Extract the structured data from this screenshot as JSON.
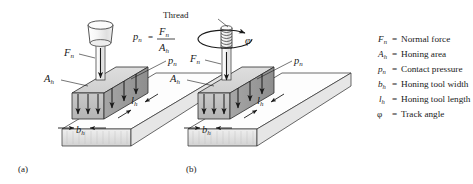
{
  "figure": {
    "background": "#ffffff",
    "ink": "#1a1a1a",
    "captions": [
      {
        "id": "a",
        "text": "(a)"
      },
      {
        "id": "b",
        "text": "(b)"
      }
    ]
  },
  "panel_a": {
    "caption": "(a)",
    "labels": {
      "normal_force": "F",
      "normal_force_sub": "n",
      "honing_area": "A",
      "honing_area_sub": "h",
      "contact_pressure": "p",
      "contact_pressure_sub": "n",
      "width": "b",
      "width_sub": "h",
      "length": "l",
      "length_sub": "h"
    }
  },
  "panel_b": {
    "caption": "(b)",
    "thread_label": "Thread",
    "track_angle_symbol": "φ",
    "formula": {
      "lhs": "p",
      "lhs_sub": "n",
      "equals": "=",
      "numerator": "F",
      "numerator_sub": "n",
      "denominator": "A",
      "denominator_sub": "h"
    },
    "labels": {
      "normal_force": "F",
      "normal_force_sub": "n",
      "honing_area": "A",
      "honing_area_sub": "h",
      "contact_pressure": "p",
      "contact_pressure_sub": "n",
      "width": "b",
      "width_sub": "h",
      "length": "l",
      "length_sub": "h"
    }
  },
  "legend": {
    "entries": [
      {
        "symbol": "F",
        "sub": "n",
        "equals": "=",
        "description": "Normal force"
      },
      {
        "symbol": "A",
        "sub": "h",
        "equals": "=",
        "description": "Honing area"
      },
      {
        "symbol": "p",
        "sub": "n",
        "equals": "=",
        "description": "Contact pressure"
      },
      {
        "symbol": "b",
        "sub": "h",
        "equals": "=",
        "description": "Honing tool width"
      },
      {
        "symbol": "l",
        "sub": "h",
        "equals": "=",
        "description": "Honing tool length"
      },
      {
        "symbol": "φ",
        "sub": "",
        "equals": "=",
        "description": "Track angle"
      }
    ]
  },
  "colors": {
    "slab_top": "#fdfdfd",
    "slab_side": "#e8e8e8",
    "slab_end": "#d8d8d8",
    "block_top": "#d6d6d6",
    "block_front": "#bfbfbf",
    "block_right": "#9a9a9a",
    "tool_body": "#f2f2f2",
    "tool_shade": "#dcdcdc",
    "outline": "#2b2b2b"
  }
}
